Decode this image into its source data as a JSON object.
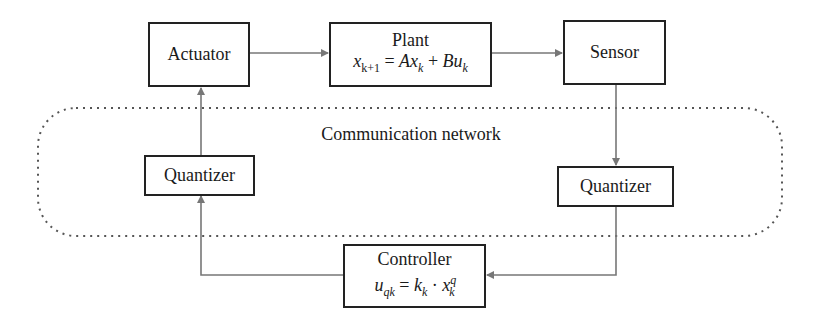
{
  "diagram": {
    "colors": {
      "box_border": "#222222",
      "connector": "#777777",
      "network_boundary": "#555555",
      "background": "#ffffff"
    },
    "nodes": {
      "actuator": {
        "label": "Actuator"
      },
      "plant": {
        "label": "Plant",
        "equation": {
          "lhs": "x",
          "lhs_sub": "k+1",
          "eq": " = ",
          "t1": "Ax",
          "t1_sub": "k",
          "plus": " + ",
          "t2": "Bu",
          "t2_sub": "k"
        }
      },
      "sensor": {
        "label": "Sensor"
      },
      "quantizer_left": {
        "label": "Quantizer"
      },
      "quantizer_right": {
        "label": "Quantizer"
      },
      "controller": {
        "label": "Controller",
        "equation": {
          "lhs": "u",
          "lhs_sub": "qk",
          "eq": " = ",
          "t1": "k",
          "t1_sub": "k",
          "dot": " · ",
          "t2": "x",
          "t2_sub": "k",
          "t2_sup": "q"
        }
      }
    },
    "network": {
      "label": "Communication network",
      "style": "dashed rounded rectangle"
    },
    "edges": [
      {
        "from": "actuator",
        "to": "plant"
      },
      {
        "from": "plant",
        "to": "sensor"
      },
      {
        "from": "sensor",
        "to": "quantizer_right"
      },
      {
        "from": "quantizer_right",
        "to": "controller"
      },
      {
        "from": "controller",
        "to": "quantizer_left"
      },
      {
        "from": "quantizer_left",
        "to": "actuator"
      }
    ]
  }
}
